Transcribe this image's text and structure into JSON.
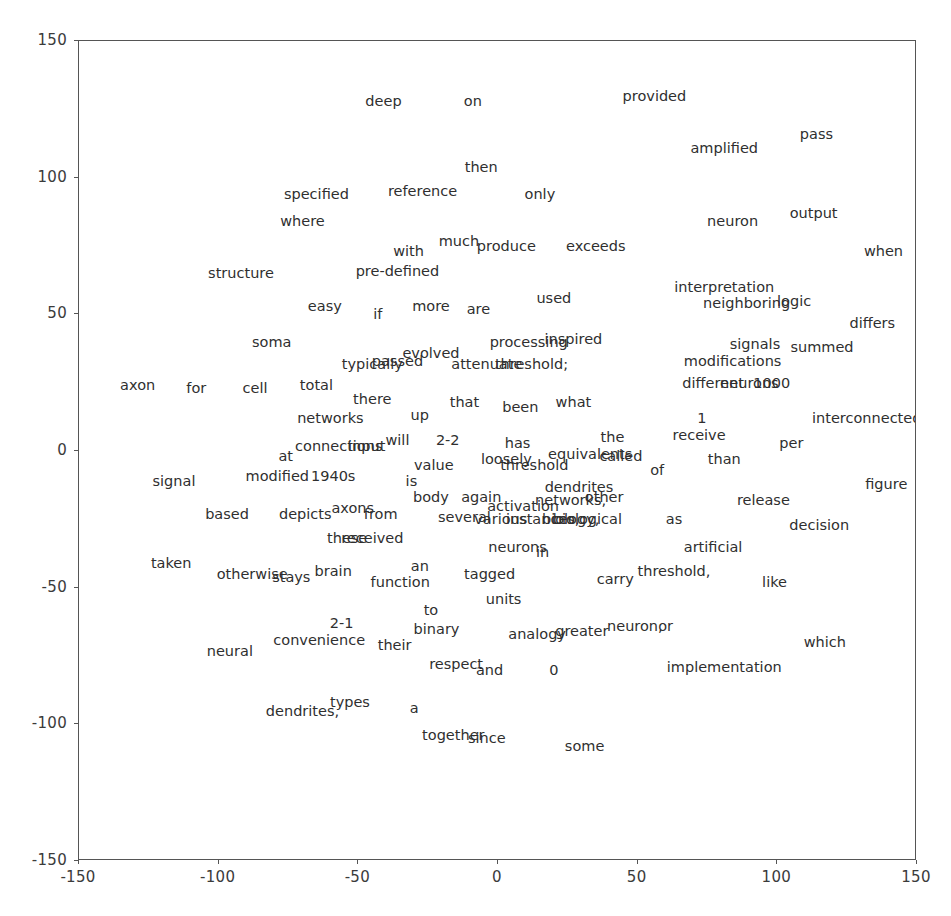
{
  "chart_data": {
    "type": "scatter",
    "title": "",
    "subtitle": "",
    "xlabel": "",
    "ylabel": "",
    "xlim": [
      -150,
      150
    ],
    "ylim": [
      -150,
      150
    ],
    "xticks": [
      -150,
      -100,
      -50,
      0,
      50,
      100,
      150
    ],
    "yticks": [
      -150,
      -100,
      -50,
      0,
      50,
      100,
      150
    ],
    "xticklabels": [
      "-150",
      "-100",
      "-50",
      "0",
      "50",
      "100",
      "150"
    ],
    "yticklabels": [
      "-150",
      "-100",
      "-50",
      "0",
      "50",
      "100",
      "150"
    ],
    "grid": false,
    "legend": null,
    "marker_style": "text-label-only",
    "point_color": "#2f2f2f",
    "frame_color": "#555555",
    "background_color": "#ffffff",
    "annotations": [
      {
        "label": "deep",
        "x": -41,
        "y": 128
      },
      {
        "label": "on",
        "x": -9,
        "y": 128
      },
      {
        "label": "provided",
        "x": 56,
        "y": 130
      },
      {
        "label": "amplified",
        "x": 81,
        "y": 111
      },
      {
        "label": "pass",
        "x": 114,
        "y": 116
      },
      {
        "label": "then",
        "x": -6,
        "y": 104
      },
      {
        "label": "specified",
        "x": -65,
        "y": 94
      },
      {
        "label": "reference",
        "x": -27,
        "y": 95
      },
      {
        "label": "only",
        "x": 15,
        "y": 94
      },
      {
        "label": "where",
        "x": -70,
        "y": 84
      },
      {
        "label": "neuron",
        "x": 84,
        "y": 84
      },
      {
        "label": "output",
        "x": 113,
        "y": 87
      },
      {
        "label": "with",
        "x": -32,
        "y": 73
      },
      {
        "label": "much",
        "x": -14,
        "y": 77
      },
      {
        "label": "produce",
        "x": 3,
        "y": 75
      },
      {
        "label": "exceeds",
        "x": 35,
        "y": 75
      },
      {
        "label": "when",
        "x": 138,
        "y": 73
      },
      {
        "label": "structure",
        "x": -92,
        "y": 65
      },
      {
        "label": "pre-defined",
        "x": -36,
        "y": 66
      },
      {
        "label": "interpretation",
        "x": 81,
        "y": 60
      },
      {
        "label": "easy",
        "x": -62,
        "y": 53
      },
      {
        "label": "if",
        "x": -43,
        "y": 50
      },
      {
        "label": "more",
        "x": -24,
        "y": 53
      },
      {
        "label": "are",
        "x": -7,
        "y": 52
      },
      {
        "label": "used",
        "x": 20,
        "y": 56
      },
      {
        "label": "neighboring",
        "x": 89,
        "y": 54
      },
      {
        "label": "logic",
        "x": 106,
        "y": 55
      },
      {
        "label": "differs",
        "x": 134,
        "y": 47
      },
      {
        "label": "soma",
        "x": -81,
        "y": 40
      },
      {
        "label": "processing",
        "x": 11,
        "y": 40
      },
      {
        "label": "inspired",
        "x": 27,
        "y": 41
      },
      {
        "label": "signals",
        "x": 92,
        "y": 39
      },
      {
        "label": "summed",
        "x": 116,
        "y": 38
      },
      {
        "label": "typically",
        "x": -45,
        "y": 32
      },
      {
        "label": "passed",
        "x": -36,
        "y": 33
      },
      {
        "label": "evolved",
        "x": -24,
        "y": 36
      },
      {
        "label": "attenuate",
        "x": -4,
        "y": 32
      },
      {
        "label": "threshold;",
        "x": 12,
        "y": 32
      },
      {
        "label": "modifications",
        "x": 84,
        "y": 33
      },
      {
        "label": "axon",
        "x": -129,
        "y": 24
      },
      {
        "label": "for",
        "x": -108,
        "y": 23
      },
      {
        "label": "cell",
        "x": -87,
        "y": 23
      },
      {
        "label": "total",
        "x": -65,
        "y": 24
      },
      {
        "label": "different",
        "x": 77,
        "y": 25
      },
      {
        "label": "neurons",
        "x": 90,
        "y": 25
      },
      {
        "label": "1000",
        "x": 98,
        "y": 25
      },
      {
        "label": "there",
        "x": -45,
        "y": 19
      },
      {
        "label": "that",
        "x": -12,
        "y": 18
      },
      {
        "label": "been",
        "x": 8,
        "y": 16
      },
      {
        "label": "what",
        "x": 27,
        "y": 18
      },
      {
        "label": "networks",
        "x": -60,
        "y": 12
      },
      {
        "label": "up",
        "x": -28,
        "y": 13
      },
      {
        "label": "1",
        "x": 73,
        "y": 12
      },
      {
        "label": "interconnected",
        "x": 132,
        "y": 12
      },
      {
        "label": "connections",
        "x": -57,
        "y": 2
      },
      {
        "label": "input",
        "x": -47,
        "y": 2
      },
      {
        "label": "will",
        "x": -36,
        "y": 4
      },
      {
        "label": "2-2",
        "x": -18,
        "y": 4
      },
      {
        "label": "has",
        "x": 7,
        "y": 3
      },
      {
        "label": "the",
        "x": 41,
        "y": 5
      },
      {
        "label": "receive",
        "x": 72,
        "y": 6
      },
      {
        "label": "per",
        "x": 105,
        "y": 3
      },
      {
        "label": "at",
        "x": -76,
        "y": -2
      },
      {
        "label": "value",
        "x": -23,
        "y": -5
      },
      {
        "label": "loosely",
        "x": 3,
        "y": -3
      },
      {
        "label": "equivalents",
        "x": 33,
        "y": -1
      },
      {
        "label": "called",
        "x": 44,
        "y": -2
      },
      {
        "label": "than",
        "x": 81,
        "y": -3
      },
      {
        "label": "signal",
        "x": -116,
        "y": -11
      },
      {
        "label": "modified",
        "x": -79,
        "y": -9
      },
      {
        "label": "1940s",
        "x": -59,
        "y": -9
      },
      {
        "label": "is",
        "x": -31,
        "y": -11
      },
      {
        "label": "threshold",
        "x": 13,
        "y": -5
      },
      {
        "label": "of",
        "x": 57,
        "y": -7
      },
      {
        "label": "figure",
        "x": 139,
        "y": -12
      },
      {
        "label": "dendrites",
        "x": 29,
        "y": -13
      },
      {
        "label": "body",
        "x": -24,
        "y": -17
      },
      {
        "label": "again",
        "x": -6,
        "y": -17
      },
      {
        "label": "activation",
        "x": 9,
        "y": -20
      },
      {
        "label": "networks,",
        "x": 26,
        "y": -18
      },
      {
        "label": "other",
        "x": 38,
        "y": -17
      },
      {
        "label": "release",
        "x": 95,
        "y": -18
      },
      {
        "label": "based",
        "x": -97,
        "y": -23
      },
      {
        "label": "axons",
        "x": -52,
        "y": -21
      },
      {
        "label": "depicts",
        "x": -69,
        "y": -23
      },
      {
        "label": "from",
        "x": -42,
        "y": -23
      },
      {
        "label": "several",
        "x": -12,
        "y": -24
      },
      {
        "label": "various",
        "x": 1,
        "y": -25
      },
      {
        "label": "instances,",
        "x": 16,
        "y": -25
      },
      {
        "label": "biology,",
        "x": 26,
        "y": -25
      },
      {
        "label": "biological",
        "x": 32,
        "y": -25
      },
      {
        "label": "as",
        "x": 63,
        "y": -25
      },
      {
        "label": "decision",
        "x": 115,
        "y": -27
      },
      {
        "label": "these",
        "x": -54,
        "y": -32
      },
      {
        "label": "received",
        "x": -45,
        "y": -32
      },
      {
        "label": "neurons",
        "x": 7,
        "y": -35
      },
      {
        "label": "in",
        "x": 16,
        "y": -37
      },
      {
        "label": "artificial",
        "x": 77,
        "y": -35
      },
      {
        "label": "taken",
        "x": -117,
        "y": -41
      },
      {
        "label": "otherwise",
        "x": -88,
        "y": -45
      },
      {
        "label": "stays",
        "x": -74,
        "y": -46
      },
      {
        "label": "brain",
        "x": -59,
        "y": -44
      },
      {
        "label": "an",
        "x": -28,
        "y": -42
      },
      {
        "label": "tagged",
        "x": -3,
        "y": -45
      },
      {
        "label": "carry",
        "x": 42,
        "y": -47
      },
      {
        "label": "threshold,",
        "x": 63,
        "y": -44
      },
      {
        "label": "like",
        "x": 99,
        "y": -48
      },
      {
        "label": "function",
        "x": -35,
        "y": -48
      },
      {
        "label": "units",
        "x": 2,
        "y": -54
      },
      {
        "label": "to",
        "x": -24,
        "y": -58
      },
      {
        "label": "2-1",
        "x": -56,
        "y": -63
      },
      {
        "label": "binary",
        "x": -22,
        "y": -65
      },
      {
        "label": "analogy",
        "x": 14,
        "y": -67
      },
      {
        "label": "greater",
        "x": 30,
        "y": -66
      },
      {
        "label": "neuron,",
        "x": 49,
        "y": -64
      },
      {
        "label": "or",
        "x": 60,
        "y": -64
      },
      {
        "label": "convenience",
        "x": -64,
        "y": -69
      },
      {
        "label": "their",
        "x": -37,
        "y": -71
      },
      {
        "label": "which",
        "x": 117,
        "y": -70
      },
      {
        "label": "neural",
        "x": -96,
        "y": -73
      },
      {
        "label": "respect",
        "x": -15,
        "y": -78
      },
      {
        "label": "and",
        "x": -3,
        "y": -80
      },
      {
        "label": "0",
        "x": 20,
        "y": -80
      },
      {
        "label": "implementation",
        "x": 81,
        "y": -79
      },
      {
        "label": "types",
        "x": -53,
        "y": -92
      },
      {
        "label": "a",
        "x": -30,
        "y": -94
      },
      {
        "label": "dendrites,",
        "x": -70,
        "y": -95
      },
      {
        "label": "together",
        "x": -16,
        "y": -104
      },
      {
        "label": "since",
        "x": -4,
        "y": -105
      },
      {
        "label": "some",
        "x": 31,
        "y": -108
      }
    ]
  }
}
